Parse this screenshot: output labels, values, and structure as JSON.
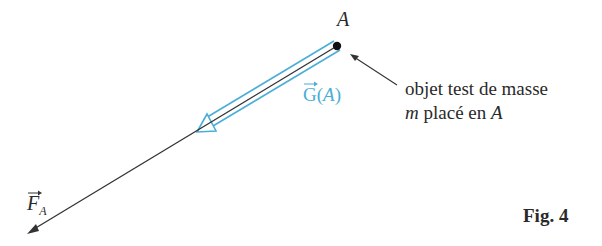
{
  "figure": {
    "caption": "Fig. 4",
    "point_label": "A",
    "vector_field_label": {
      "letter": "G",
      "arg": "(A)",
      "full": "G(A)"
    },
    "force_label": {
      "letter": "F",
      "subscript": "A"
    },
    "annotation": {
      "line1": "objet test de masse",
      "line2_var": "m",
      "line2_text": " placé en ",
      "line2_point": "A"
    },
    "colors": {
      "field_vector": "#4aaed6",
      "force_vector": "#333333",
      "text": "#2a2a2a"
    }
  }
}
